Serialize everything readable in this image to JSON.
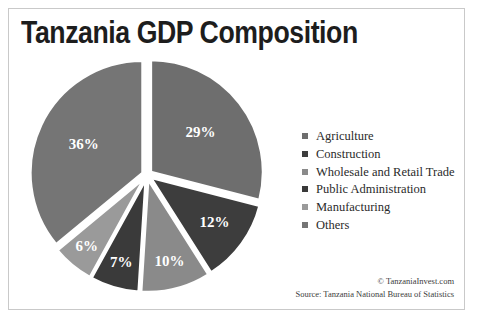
{
  "chart": {
    "title": "Tanzania GDP Composition",
    "border_color": "#c9c9c9",
    "background": "#ffffff"
  },
  "attribution": {
    "copyright": "© TanzaniaInvest.com",
    "source": "Source: Tanzania National Bureau of Statistics"
  },
  "legend": {
    "items": [
      {
        "label": "Agriculture",
        "color": "#6e6e6e"
      },
      {
        "label": "Construction",
        "color": "#3d3d3d"
      },
      {
        "label": "Wholesale and Retail Trade",
        "color": "#8a8a8a"
      },
      {
        "label": "Public Administration",
        "color": "#3a3a3a"
      },
      {
        "label": "Manufacturing",
        "color": "#9a9a9a"
      },
      {
        "label": "Others",
        "color": "#757575"
      }
    ]
  },
  "chart_data": {
    "type": "pie",
    "title": "Tanzania GDP Composition",
    "categories": [
      "Agriculture",
      "Construction",
      "Wholesale and Retail Trade",
      "Public Administration",
      "Manufacturing",
      "Others"
    ],
    "values": [
      29,
      12,
      10,
      7,
      6,
      36
    ],
    "labels": [
      "29%",
      "12%",
      "10%",
      "7%",
      "6%",
      "36%"
    ],
    "colors": [
      "#6e6e6e",
      "#3d3d3d",
      "#8a8a8a",
      "#3a3a3a",
      "#9a9a9a",
      "#757575"
    ],
    "unit": "percent",
    "exploded": true,
    "start_angle": 0,
    "direction": "clockwise",
    "legend_position": "right",
    "grid": false,
    "total": 100
  }
}
